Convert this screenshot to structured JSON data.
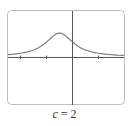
{
  "caption": {
    "variable": "c",
    "equals": "=",
    "value": "2"
  },
  "colors": {
    "frame": "#bdbdbd",
    "axes": "#555555",
    "curve": "#777777"
  },
  "graph": {
    "frame": {
      "x": 7,
      "y": 10,
      "width": 117,
      "height": 94,
      "radius": 4
    },
    "origin_px": {
      "x": 72.5,
      "y": 57
    },
    "unit_px": 26,
    "ticks_x": [
      -2,
      -1,
      1
    ],
    "peak": {
      "x": -0.5,
      "y": 0.92
    }
  },
  "chart_data": {
    "type": "line",
    "title": "c = 2",
    "xlabel": "",
    "ylabel": "",
    "x": [
      -2.5,
      -2.0,
      -1.5,
      -1.0,
      -0.75,
      -0.5,
      -0.25,
      0.0,
      0.5,
      1.0,
      1.5,
      2.0,
      2.5
    ],
    "values": [
      0.08,
      0.15,
      0.3,
      0.62,
      0.83,
      0.92,
      0.83,
      0.55,
      0.33,
      0.18,
      0.11,
      0.07,
      0.05
    ],
    "xlim": [
      -2.5,
      2.0
    ],
    "ylim": [
      -1.8,
      1.8
    ],
    "grid": false
  }
}
